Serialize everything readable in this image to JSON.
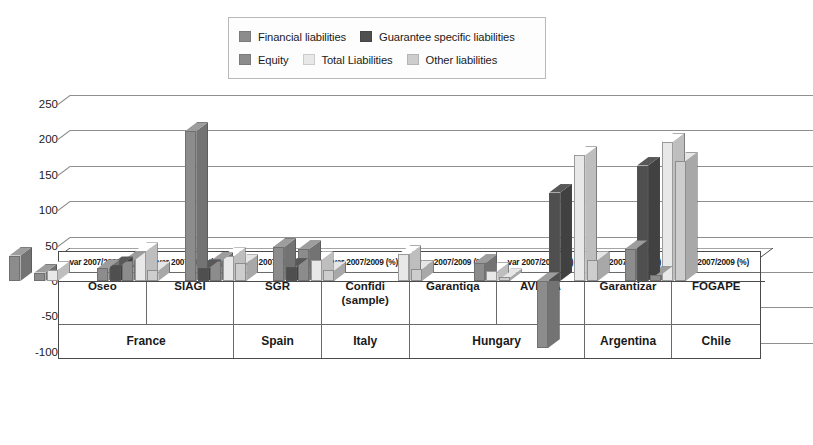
{
  "legend": {
    "rows": [
      [
        {
          "label": "Financial liabilities",
          "color": "#8c8c8c",
          "name": "legend-financial-liabilities"
        },
        {
          "label": "Guarantee specific liabilities",
          "color": "#4f4f4f",
          "name": "legend-guarantee-specific-liabilities"
        }
      ],
      [
        {
          "label": "Equity",
          "color": "#8c8c8c",
          "name": "legend-equity"
        },
        {
          "label": "Total Liabilities",
          "color": "#e8e8e8",
          "name": "legend-total-liabilities"
        },
        {
          "label": "Other liabilities",
          "color": "#cdcdcd",
          "name": "legend-other-liabilities"
        }
      ]
    ]
  },
  "chart_data": {
    "type": "bar",
    "title": "",
    "subtitle": "",
    "xlabel": "",
    "ylabel": "",
    "ylim": [
      -100,
      250
    ],
    "yticks": [
      250,
      200,
      150,
      100,
      50,
      0,
      -50,
      -100
    ],
    "ytick_labels": [
      "250",
      "200",
      "150",
      "100",
      "50",
      "0",
      "-50",
      "-100"
    ],
    "grid": true,
    "legend_position": "top-center",
    "three_d": true,
    "unit_row_label": "var 2007/2009 (%)",
    "categories": [
      "Oseo",
      "SIAGI",
      "SGR",
      "Confidi (sample)",
      "Garantiqa",
      "AVHGA",
      "Garantizar",
      "FOGAPE"
    ],
    "category_lines": [
      [
        "Oseo"
      ],
      [
        "SIAGI"
      ],
      [
        "SGR"
      ],
      [
        "Confidi",
        "(sample)"
      ],
      [
        "Garantiqa"
      ],
      [
        "AVHGA"
      ],
      [
        "Garantizar"
      ],
      [
        "FOGAPE"
      ]
    ],
    "countries": [
      {
        "name": "France",
        "span": 2
      },
      {
        "name": "Spain",
        "span": 1
      },
      {
        "name": "Italy",
        "span": 1
      },
      {
        "name": "Hungary",
        "span": 2
      },
      {
        "name": "Argentina",
        "span": 1
      },
      {
        "name": "Chile",
        "span": 1
      }
    ],
    "series": [
      {
        "name": "Financial liabilities",
        "color": "#8c8c8c",
        "values": [
          36,
          18,
          212,
          48,
          null,
          null,
          -95,
          45
        ]
      },
      {
        "name": "Guarantee specific liabilities",
        "color": "#4f4f4f",
        "values": [
          null,
          22,
          18,
          20,
          null,
          null,
          125,
          163
        ]
      },
      {
        "name": "Equity",
        "color": "#8c8c8c",
        "values": [
          12,
          28,
          28,
          45,
          null,
          25,
          null,
          8
        ]
      },
      {
        "name": "Total Liabilities",
        "color": "#e8e8e8",
        "values": [
          16,
          42,
          35,
          30,
          38,
          14,
          178,
          197
        ]
      },
      {
        "name": "Other liabilities",
        "color": "#cdcdcd",
        "values": [
          null,
          15,
          25,
          15,
          17,
          5,
          30,
          170
        ]
      }
    ]
  }
}
